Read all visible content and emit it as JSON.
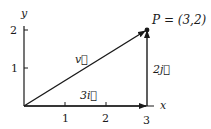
{
  "diagram": {
    "axes": {
      "x_label": "x",
      "y_label": "y",
      "x_ticks": [
        "1",
        "2",
        "3"
      ],
      "y_ticks": [
        "1",
        "2"
      ]
    },
    "vectors": {
      "v": {
        "label": "v⃗",
        "from": [
          0,
          0
        ],
        "to": [
          3,
          2
        ]
      },
      "three_i": {
        "label": "3i⃗",
        "from": [
          0,
          0
        ],
        "to": [
          3,
          0
        ]
      },
      "two_j": {
        "label": "2j⃗",
        "from": [
          3,
          0
        ],
        "to": [
          3,
          2
        ]
      }
    },
    "point": {
      "label": "P = (3,2)",
      "coords": [
        3,
        2
      ]
    },
    "colors": {
      "ink": "#1a1a1a",
      "background": "#ffffff"
    }
  }
}
